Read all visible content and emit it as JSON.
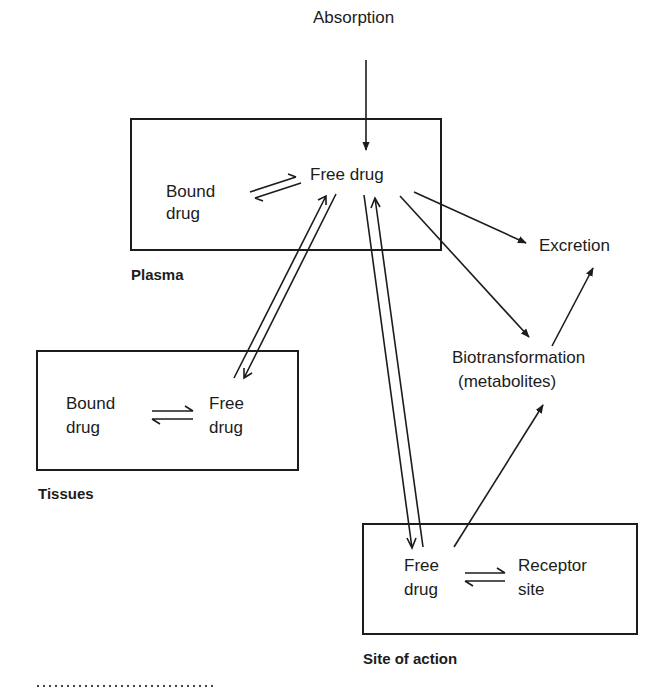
{
  "diagram": {
    "inputs": {
      "absorption": "Absorption"
    },
    "plasma": {
      "label": "Plasma",
      "bound": [
        "Bound",
        "drug"
      ],
      "free": "Free drug"
    },
    "tissues": {
      "label": "Tissues",
      "bound": [
        "Bound",
        "drug"
      ],
      "free": [
        "Free",
        "drug"
      ]
    },
    "site_of_action": {
      "label": "Site of action",
      "free": [
        "Free",
        "drug"
      ],
      "receptor": [
        "Receptor",
        "site"
      ]
    },
    "outputs": {
      "excretion": "Excretion",
      "biotransformation": [
        "Biotransformation",
        "(metabolites)"
      ]
    },
    "edges": [
      {
        "from": "Absorption",
        "to": "Plasma free drug",
        "type": "one-way"
      },
      {
        "from": "Plasma bound drug",
        "to": "Plasma free drug",
        "type": "equilibrium"
      },
      {
        "from": "Plasma free drug",
        "to": "Tissues free drug",
        "type": "two-way"
      },
      {
        "from": "Plasma free drug",
        "to": "Site of action free drug",
        "type": "two-way"
      },
      {
        "from": "Plasma free drug",
        "to": "Excretion",
        "type": "one-way"
      },
      {
        "from": "Plasma free drug",
        "to": "Biotransformation",
        "type": "one-way"
      },
      {
        "from": "Biotransformation",
        "to": "Excretion",
        "type": "one-way"
      },
      {
        "from": "Site of action free drug",
        "to": "Biotransformation",
        "type": "one-way"
      },
      {
        "from": "Tissues bound drug",
        "to": "Tissues free drug",
        "type": "equilibrium"
      },
      {
        "from": "Site free drug",
        "to": "Receptor site",
        "type": "equilibrium"
      }
    ],
    "colors": {
      "ink": "#1c1c1c",
      "background": "#ffffff"
    }
  }
}
